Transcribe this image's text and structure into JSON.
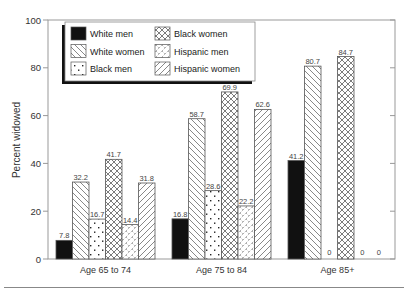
{
  "chart_data": {
    "type": "bar",
    "title": "",
    "xlabel": "",
    "ylabel": "Percent widowed",
    "ylim": [
      0,
      100
    ],
    "yticks": [
      0,
      20,
      40,
      60,
      80,
      100
    ],
    "grid": false,
    "legend_position": "upper-left-inside",
    "categories": [
      "Age 65 to 74",
      "Age 75 to 84",
      "Age 85+"
    ],
    "series": [
      {
        "name": "White men",
        "pattern": "solid-black",
        "values": [
          7.8,
          16.8,
          41.2
        ],
        "labels": [
          "7.8",
          "16.8",
          "41.2"
        ]
      },
      {
        "name": "White women",
        "pattern": "back-diagonal",
        "values": [
          32.2,
          58.7,
          80.7
        ],
        "labels": [
          "32.2",
          "58.7",
          "80.7"
        ]
      },
      {
        "name": "Black men",
        "pattern": "dots",
        "values": [
          16.7,
          28.6,
          0
        ],
        "labels": [
          "16.7",
          "28.6",
          "0"
        ]
      },
      {
        "name": "Black women",
        "pattern": "crosshatch",
        "values": [
          41.7,
          69.9,
          84.7
        ],
        "labels": [
          "41.7",
          "69.9",
          "84.7"
        ]
      },
      {
        "name": "Hispanic men",
        "pattern": "zigzag",
        "values": [
          14.4,
          22.2,
          0
        ],
        "labels": [
          "14.4",
          "22.2",
          "0"
        ]
      },
      {
        "name": "Hispanic women",
        "pattern": "forward-diagonal",
        "values": [
          31.8,
          62.6,
          0
        ],
        "labels": [
          "31.8",
          "62.6",
          "0"
        ]
      }
    ]
  },
  "legend": {
    "items": [
      {
        "label": "White men",
        "pattern": "solid-black"
      },
      {
        "label": "White women",
        "pattern": "back-diagonal"
      },
      {
        "label": "Black men",
        "pattern": "dots"
      },
      {
        "label": "Black women",
        "pattern": "crosshatch"
      },
      {
        "label": "Hispanic men",
        "pattern": "zigzag"
      },
      {
        "label": "Hispanic women",
        "pattern": "forward-diagonal"
      }
    ]
  },
  "colors": {
    "axis": "#888888",
    "bar_outline": "#555555",
    "solid": "#111111",
    "text": "#333333"
  }
}
